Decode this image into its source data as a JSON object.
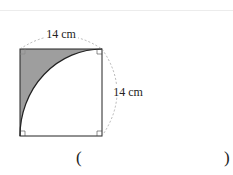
{
  "figure": {
    "top_label": "14 cm",
    "side_label": "14 cm",
    "shaded_color": "#9e9e9e"
  },
  "answer": {
    "open_paren": "(",
    "close_paren": ")"
  }
}
